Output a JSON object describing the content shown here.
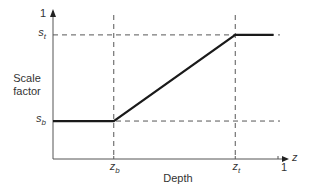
{
  "chart_data": {
    "type": "line",
    "title": "",
    "xlabel": "Depth",
    "ylabel": "Scale factor",
    "x_axis_symbol": "z",
    "xlim": [
      0,
      1
    ],
    "ylim": [
      0,
      1
    ],
    "x_ticks": [
      {
        "value": 0.27,
        "label": "z",
        "sub": "b"
      },
      {
        "value": 0.81,
        "label": "z",
        "sub": "t"
      },
      {
        "value": 1.0,
        "label": "1",
        "sub": ""
      }
    ],
    "y_ticks": [
      {
        "value": 0.26,
        "label": "s",
        "sub": "b"
      },
      {
        "value": 0.85,
        "label": "s",
        "sub": "t"
      },
      {
        "value": 1.0,
        "label": "1",
        "sub": ""
      }
    ],
    "series": [
      {
        "name": "scale factor",
        "points": [
          {
            "x": 0.0,
            "y": 0.26
          },
          {
            "x": 0.27,
            "y": 0.26
          },
          {
            "x": 0.81,
            "y": 0.85
          },
          {
            "x": 0.98,
            "y": 0.85
          }
        ]
      }
    ],
    "guides": {
      "vertical": [
        0.27,
        0.81
      ],
      "horizontal": [
        0.26,
        0.85
      ]
    },
    "grid": false,
    "legend": "none"
  }
}
